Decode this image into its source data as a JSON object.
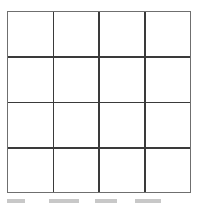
{
  "grid": {
    "rows": 4,
    "columns": 4,
    "outer_border_color": "#6f6f6f",
    "inner_line_color": "#3a3a3a",
    "vertical_lines_pct": [
      25,
      50,
      75
    ],
    "horizontal_lines_pct": [
      25,
      50,
      75
    ]
  },
  "caption": {
    "text": "",
    "note": "clipped"
  }
}
